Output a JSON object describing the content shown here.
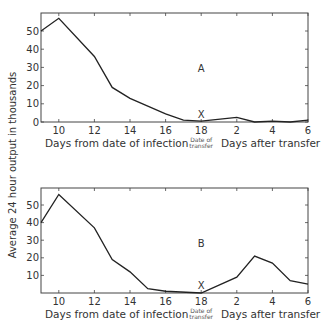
{
  "chart_data": [
    {
      "type": "line",
      "panel": "A",
      "title": "",
      "annotation_letter": "A",
      "marker_label": "X",
      "marker_at": "18",
      "xlabel_left": "Days from date of infection",
      "xlabel_right": "Days after transfer",
      "transfer_label_line1": "Date of",
      "transfer_label_line2": "transfer",
      "ylabel": "Average 24 hour output in thousands",
      "x_tick_labels": [
        "10",
        "12",
        "14",
        "16",
        "18",
        "2",
        "4",
        "6"
      ],
      "y_tick_labels": [
        "0",
        "10",
        "20",
        "30",
        "40",
        "50"
      ],
      "ylim": [
        0,
        60
      ],
      "grid": false,
      "x": [
        "9",
        "10",
        "12",
        "13",
        "14",
        "16",
        "17",
        "18",
        "2",
        "3",
        "4",
        "5",
        "6"
      ],
      "values": [
        50,
        57,
        36,
        19,
        13,
        4.5,
        1,
        0.5,
        2.5,
        0,
        0.5,
        0,
        1
      ]
    },
    {
      "type": "line",
      "panel": "B",
      "title": "",
      "annotation_letter": "B",
      "marker_label": "X",
      "marker_at": "18",
      "xlabel_left": "Days from date of infection",
      "xlabel_right": "Days after transfer",
      "transfer_label_line1": "Date of",
      "transfer_label_line2": "transfer",
      "ylabel": "Average 24 hour output in thousands",
      "x_tick_labels": [
        "10",
        "12",
        "14",
        "16",
        "18",
        "2",
        "4",
        "6"
      ],
      "y_tick_labels": [
        "10",
        "20",
        "30",
        "40",
        "50"
      ],
      "ylim": [
        0,
        60
      ],
      "grid": false,
      "x": [
        "9",
        "10",
        "12",
        "13",
        "14",
        "15",
        "16",
        "18",
        "2",
        "3",
        "4",
        "5",
        "6"
      ],
      "values": [
        40,
        56,
        37,
        19,
        12,
        2.5,
        1,
        0,
        9,
        21,
        17,
        7,
        5
      ]
    }
  ],
  "shared": {
    "ylabel": "Average 24 hour output in thousands"
  }
}
